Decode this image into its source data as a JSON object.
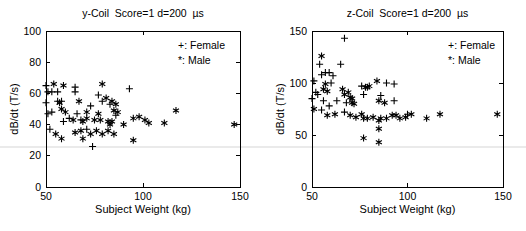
{
  "figure": {
    "background": "#ffffff",
    "ink_color": "#000000",
    "artifact_line_color": "#eaeaea"
  },
  "chart_data": [
    {
      "type": "scatter",
      "title": "y-Coil  Score=1 d=200  µs",
      "xlabel": "Subject Weight (kg)",
      "ylabel": "dB/dt (T/s)",
      "xlim": [
        50,
        150
      ],
      "ylim": [
        0,
        100
      ],
      "xticks": [
        50,
        100,
        150
      ],
      "yticks": [
        0,
        20,
        40,
        60,
        80,
        100
      ],
      "grid": false,
      "legend_position": "top-right-inside",
      "legend": [
        "+: Female",
        "*: Male"
      ],
      "series": [
        {
          "name": "Female",
          "marker": "plus",
          "points": [
            [
              50,
              65
            ],
            [
              51,
              61
            ],
            [
              53,
              61
            ],
            [
              56,
              61
            ],
            [
              65,
              64
            ],
            [
              50,
              54
            ],
            [
              56,
              55
            ],
            [
              58,
              55
            ],
            [
              65,
              61
            ],
            [
              51,
              47
            ],
            [
              53,
              48
            ],
            [
              66,
              47
            ],
            [
              68,
              43
            ],
            [
              62,
              44
            ],
            [
              59,
              42
            ],
            [
              52,
              37
            ],
            [
              71,
              37
            ],
            [
              73,
              52
            ],
            [
              77,
              59
            ],
            [
              79,
              55
            ],
            [
              83,
              53
            ],
            [
              86,
              46
            ],
            [
              93,
              63
            ],
            [
              74,
              26
            ]
          ]
        },
        {
          "name": "Male",
          "marker": "asterisk",
          "points": [
            [
              54,
              66
            ],
            [
              59,
              65
            ],
            [
              79,
              66
            ],
            [
              57,
              54
            ],
            [
              67,
              55
            ],
            [
              81,
              57
            ],
            [
              84,
              55
            ],
            [
              58,
              50
            ],
            [
              60,
              48
            ],
            [
              71,
              48
            ],
            [
              77,
              47
            ],
            [
              86,
              53
            ],
            [
              85,
              49
            ],
            [
              87,
              48
            ],
            [
              64,
              43
            ],
            [
              69,
              42
            ],
            [
              71,
              44
            ],
            [
              75,
              43
            ],
            [
              78,
              43
            ],
            [
              82,
              42
            ],
            [
              84,
              42
            ],
            [
              83,
              40
            ],
            [
              90,
              40
            ],
            [
              55,
              34
            ],
            [
              65,
              35
            ],
            [
              68,
              36
            ],
            [
              73,
              34
            ],
            [
              76,
              36
            ],
            [
              79,
              34
            ],
            [
              82,
              36
            ],
            [
              85,
              34
            ],
            [
              58,
              31
            ],
            [
              69,
              31
            ],
            [
              95,
              44
            ],
            [
              95,
              30
            ],
            [
              98,
              45
            ],
            [
              101,
              43
            ],
            [
              103,
              41
            ],
            [
              111,
              41
            ],
            [
              117,
              49
            ],
            [
              147,
              40
            ]
          ]
        }
      ]
    },
    {
      "type": "scatter",
      "title": "z-Coil  Score=1 d=200  µs",
      "xlabel": "Subject Weight (kg)",
      "ylabel": "dB/dt (T/s)",
      "xlim": [
        50,
        150
      ],
      "ylim": [
        0,
        150
      ],
      "xticks": [
        50,
        100,
        150
      ],
      "yticks": [
        0,
        50,
        100,
        150
      ],
      "grid": false,
      "legend_position": "top-right-inside",
      "legend": [
        "+: Female",
        "*: Male"
      ],
      "series": [
        {
          "name": "Female",
          "marker": "plus",
          "points": [
            [
              50,
              85
            ],
            [
              51,
              102
            ],
            [
              52,
              91
            ],
            [
              53,
              89
            ],
            [
              54,
              118
            ],
            [
              55,
              108
            ],
            [
              55,
              74
            ],
            [
              56,
              83
            ],
            [
              57,
              110
            ],
            [
              59,
              110
            ],
            [
              59,
              78
            ],
            [
              60,
              100
            ],
            [
              61,
              107
            ],
            [
              63,
              83
            ],
            [
              65,
              118
            ],
            [
              67,
              143
            ],
            [
              67,
              72
            ],
            [
              68,
              81
            ],
            [
              76,
              97
            ],
            [
              77,
              89
            ],
            [
              86,
              88
            ],
            [
              89,
              100
            ],
            [
              93,
              99
            ],
            [
              93,
              83
            ],
            [
              100,
              70
            ]
          ]
        },
        {
          "name": "Male",
          "marker": "asterisk",
          "points": [
            [
              51,
              75
            ],
            [
              55,
              126
            ],
            [
              56,
              94
            ],
            [
              57,
              99
            ],
            [
              58,
              92
            ],
            [
              58,
              69
            ],
            [
              62,
              70
            ],
            [
              66,
              94
            ],
            [
              67,
              89
            ],
            [
              69,
              91
            ],
            [
              70,
              86
            ],
            [
              70,
              69
            ],
            [
              71,
              85
            ],
            [
              71,
              81
            ],
            [
              72,
              80
            ],
            [
              73,
              67
            ],
            [
              76,
              70
            ],
            [
              77,
              66
            ],
            [
              77,
              47
            ],
            [
              78,
              96
            ],
            [
              79,
              96
            ],
            [
              79,
              66
            ],
            [
              80,
              97
            ],
            [
              82,
              67
            ],
            [
              84,
              102
            ],
            [
              85,
              83
            ],
            [
              85,
              64
            ],
            [
              85,
              56
            ],
            [
              85,
              43
            ],
            [
              86,
              66
            ],
            [
              88,
              81
            ],
            [
              89,
              66
            ],
            [
              92,
              69
            ],
            [
              94,
              69
            ],
            [
              96,
              66
            ],
            [
              99,
              67
            ],
            [
              102,
              70
            ],
            [
              110,
              66
            ],
            [
              117,
              70
            ],
            [
              147,
              70
            ]
          ]
        }
      ]
    }
  ]
}
